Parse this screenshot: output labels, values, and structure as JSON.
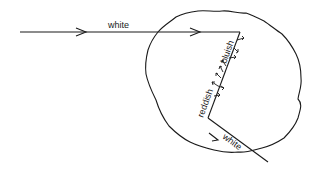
{
  "diagram": {
    "labels": {
      "incoming": "white",
      "upper_edge": "bluish",
      "lower_edge": "reddish",
      "outgoing": "white"
    },
    "colors": {
      "stroke": "#1a1a1a",
      "background": "#ffffff"
    }
  }
}
